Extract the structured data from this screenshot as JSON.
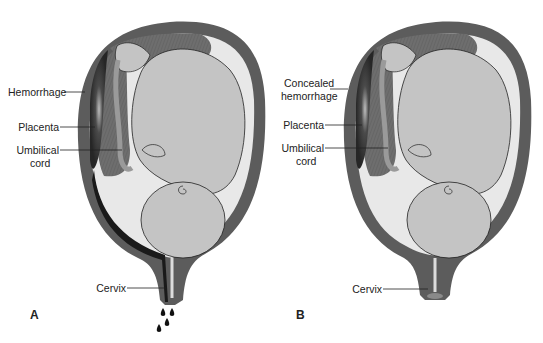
{
  "figure": {
    "panels": [
      {
        "id": "A",
        "letter": "A",
        "labels": {
          "hemorrhage": "Hemorrhage",
          "placenta": "Placenta",
          "umbilical_line1": "Umbilical",
          "umbilical_line2": "cord",
          "cervix": "Cervix"
        },
        "external_bleeding": true,
        "blood_drops": 4
      },
      {
        "id": "B",
        "letter": "B",
        "labels": {
          "hemorrhage_line1": "Concealed",
          "hemorrhage_line2": "hemorrhage",
          "placenta": "Placenta",
          "umbilical_line1": "Umbilical",
          "umbilical_line2": "cord",
          "cervix": "Cervix"
        },
        "external_bleeding": false,
        "blood_drops": 0
      }
    ],
    "colors": {
      "uterine_wall": "#5a5a5a",
      "amniotic_fluid": "#e6e6e6",
      "fetus": "#c4c4c4",
      "placenta": "#7a7a7a",
      "hemorrhage": "#2a2a2a",
      "blood": "#1a1a1a"
    }
  }
}
